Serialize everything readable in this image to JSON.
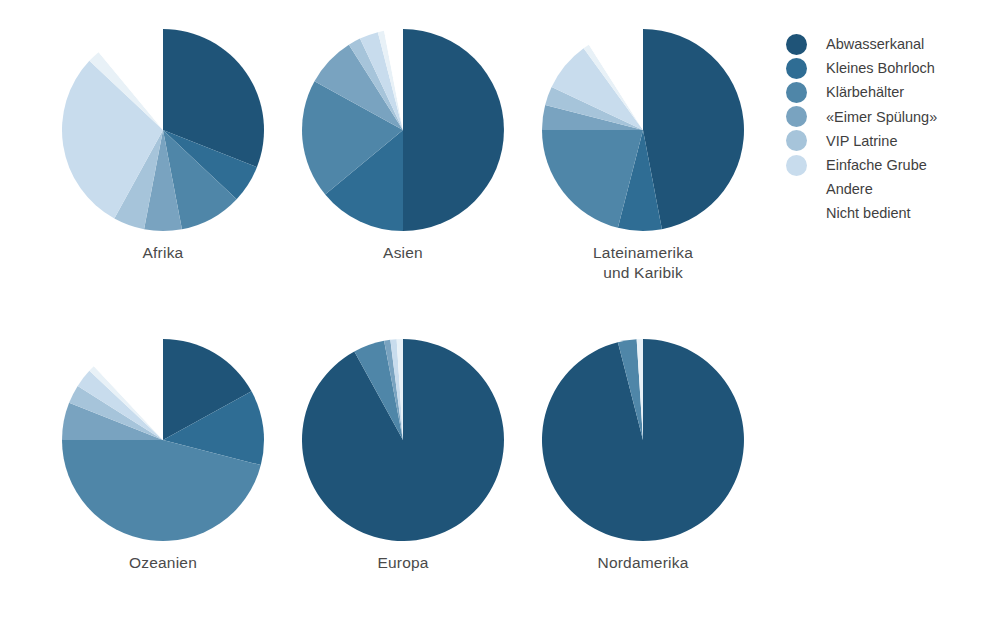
{
  "chart_data": {
    "type": "pie",
    "title": "",
    "legend_position": "right",
    "categories": [
      "Abwasserkanal",
      "Kleines Bohrloch",
      "Klärbehälter",
      "«Eimer Spülung»",
      "VIP Latrine",
      "Einfache Grube",
      "Andere",
      "Nicht bedient"
    ],
    "colors": [
      "#1f5478",
      "#2f6d94",
      "#4f86a8",
      "#79a3c0",
      "#a6c4da",
      "#c8dced",
      "#e8f1f7",
      "#ffffff"
    ],
    "unit": "percent",
    "charts": [
      {
        "label": "Afrika",
        "label_lines": [
          "Afrika"
        ],
        "values": [
          31,
          6,
          10,
          6,
          5,
          29,
          2,
          11
        ]
      },
      {
        "label": "Asien",
        "label_lines": [
          "Asien"
        ],
        "values": [
          50,
          14,
          19,
          8,
          2,
          3,
          1,
          3
        ]
      },
      {
        "label": "Lateinamerika und Karibik",
        "label_lines": [
          "Lateinamerika",
          "und Karibik"
        ],
        "values": [
          47,
          7,
          21,
          4,
          3,
          8,
          1,
          9
        ]
      },
      {
        "label": "Ozeanien",
        "label_lines": [
          "Ozeanien"
        ],
        "values": [
          17,
          12,
          46,
          6,
          3,
          3,
          1,
          12
        ]
      },
      {
        "label": "Europa",
        "label_lines": [
          "Europa"
        ],
        "values": [
          92,
          0,
          5,
          1,
          0,
          1,
          1,
          0
        ]
      },
      {
        "label": "Nordamerika",
        "label_lines": [
          "Nordamerika"
        ],
        "values": [
          96,
          0,
          3,
          0,
          0,
          0,
          1,
          0
        ]
      }
    ]
  },
  "legend": {
    "items": [
      {
        "label": "Abwasserkanal",
        "color": "#1f5478",
        "swatch_visible": true
      },
      {
        "label": "Kleines Bohrloch",
        "color": "#2f6d94",
        "swatch_visible": true
      },
      {
        "label": "Klärbehälter",
        "color": "#4f86a8",
        "swatch_visible": true
      },
      {
        "label": "«Eimer Spülung»",
        "color": "#79a3c0",
        "swatch_visible": true
      },
      {
        "label": "VIP Latrine",
        "color": "#a6c4da",
        "swatch_visible": true
      },
      {
        "label": "Einfache Grube",
        "color": "#c8dced",
        "swatch_visible": true
      },
      {
        "label": "Andere",
        "color": "#f2f7fb",
        "swatch_visible": false
      },
      {
        "label": "Nicht bedient",
        "color": "#ffffff",
        "swatch_visible": false
      }
    ]
  },
  "layout": {
    "pie_positions": [
      {
        "left": 48,
        "top": 22
      },
      {
        "left": 288,
        "top": 22
      },
      {
        "left": 528,
        "top": 22
      },
      {
        "left": 48,
        "top": 332
      },
      {
        "left": 288,
        "top": 332
      },
      {
        "left": 528,
        "top": 332
      }
    ],
    "radius": 101,
    "label_color": "#4a4a4a",
    "background": "#ffffff"
  }
}
